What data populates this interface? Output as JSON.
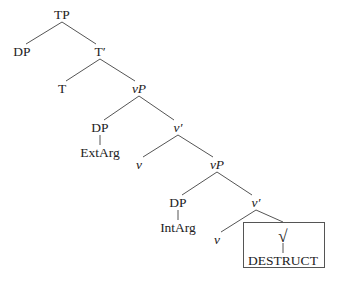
{
  "tree": {
    "nodes": [
      {
        "id": "tp",
        "label": "TP",
        "x": 62,
        "y": 15,
        "italic": false
      },
      {
        "id": "dp1",
        "label": "DP",
        "x": 22,
        "y": 52,
        "italic": false
      },
      {
        "id": "tbar",
        "label": "T′",
        "x": 100,
        "y": 52,
        "italic": false
      },
      {
        "id": "t",
        "label": "T",
        "x": 62,
        "y": 89,
        "italic": false
      },
      {
        "id": "vp1",
        "label": "vP",
        "x": 139,
        "y": 89,
        "italic": true
      },
      {
        "id": "dp2",
        "label": "DP",
        "x": 100,
        "y": 128,
        "italic": false
      },
      {
        "id": "vbar1",
        "label": "v′",
        "x": 178,
        "y": 128,
        "italic": true
      },
      {
        "id": "extarg",
        "label": "ExtArg",
        "x": 100,
        "y": 153,
        "italic": false
      },
      {
        "id": "v1",
        "label": "v",
        "x": 139,
        "y": 165,
        "italic": true
      },
      {
        "id": "vp2",
        "label": "vP",
        "x": 217,
        "y": 165,
        "italic": true
      },
      {
        "id": "dp3",
        "label": "DP",
        "x": 178,
        "y": 203,
        "italic": false
      },
      {
        "id": "vbar2",
        "label": "v′",
        "x": 256,
        "y": 203,
        "italic": true
      },
      {
        "id": "intarg",
        "label": "IntArg",
        "x": 178,
        "y": 228,
        "italic": false
      },
      {
        "id": "v2",
        "label": "v",
        "x": 217,
        "y": 240,
        "italic": true
      },
      {
        "id": "root",
        "label": "√",
        "x": 283,
        "y": 236,
        "italic": false
      },
      {
        "id": "destruct",
        "label": "DESTRUCT",
        "x": 283,
        "y": 261,
        "italic": false
      }
    ],
    "edges": [
      {
        "from": [
          62,
          22
        ],
        "to": [
          26,
          44
        ]
      },
      {
        "from": [
          62,
          22
        ],
        "to": [
          96,
          44
        ]
      },
      {
        "from": [
          100,
          59
        ],
        "to": [
          66,
          81
        ]
      },
      {
        "from": [
          100,
          59
        ],
        "to": [
          135,
          81
        ]
      },
      {
        "from": [
          139,
          96
        ],
        "to": [
          104,
          120
        ]
      },
      {
        "from": [
          139,
          96
        ],
        "to": [
          174,
          120
        ]
      },
      {
        "from": [
          100,
          135
        ],
        "to": [
          100,
          145
        ]
      },
      {
        "from": [
          178,
          135
        ],
        "to": [
          143,
          157
        ]
      },
      {
        "from": [
          178,
          135
        ],
        "to": [
          213,
          157
        ]
      },
      {
        "from": [
          217,
          172
        ],
        "to": [
          182,
          195
        ]
      },
      {
        "from": [
          217,
          172
        ],
        "to": [
          252,
          195
        ]
      },
      {
        "from": [
          178,
          210
        ],
        "to": [
          178,
          220
        ]
      },
      {
        "from": [
          256,
          210
        ],
        "to": [
          221,
          232
        ]
      },
      {
        "from": [
          256,
          210
        ],
        "to": [
          283,
          222
        ]
      },
      {
        "from": [
          283,
          243
        ],
        "to": [
          283,
          253
        ]
      }
    ],
    "box": {
      "label": "root-box",
      "x": 243,
      "y": 222,
      "width": 82,
      "height": 46
    },
    "line_color": "#555555"
  }
}
